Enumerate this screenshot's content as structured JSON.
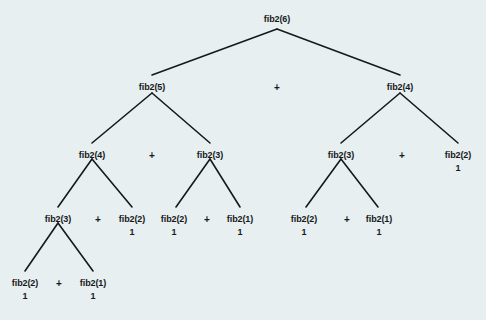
{
  "diagram": {
    "background_color": "#e7eff0",
    "ink_color": "#16191c",
    "levels": 5,
    "nodes": [
      {
        "id": "n0",
        "label": "fib2(6)",
        "value": "",
        "x": 277,
        "y": 14
      },
      {
        "id": "n1",
        "label": "fib2(5)",
        "value": "",
        "x": 152,
        "y": 82
      },
      {
        "id": "n2",
        "label": "fib2(4)",
        "value": "",
        "x": 400,
        "y": 82
      },
      {
        "id": "n3",
        "label": "fib2(4)",
        "value": "",
        "x": 92,
        "y": 150
      },
      {
        "id": "n4",
        "label": "fib2(3)",
        "value": "",
        "x": 210,
        "y": 150
      },
      {
        "id": "n5",
        "label": "fib2(3)",
        "value": "",
        "x": 341,
        "y": 150
      },
      {
        "id": "n6",
        "label": "fib2(2)",
        "value": "1",
        "x": 458,
        "y": 150
      },
      {
        "id": "n7",
        "label": "fib2(3)",
        "value": "",
        "x": 58,
        "y": 214
      },
      {
        "id": "n8",
        "label": "fib2(2)",
        "value": "1",
        "x": 132,
        "y": 214
      },
      {
        "id": "n9",
        "label": "fib2(2)",
        "value": "1",
        "x": 174,
        "y": 214
      },
      {
        "id": "n10",
        "label": "fib2(1)",
        "value": "1",
        "x": 240,
        "y": 214
      },
      {
        "id": "n11",
        "label": "fib2(2)",
        "value": "1",
        "x": 304,
        "y": 214
      },
      {
        "id": "n12",
        "label": "fib2(1)",
        "value": "1",
        "x": 379,
        "y": 214
      },
      {
        "id": "n13",
        "label": "fib2(2)",
        "value": "1",
        "x": 25,
        "y": 278
      },
      {
        "id": "n14",
        "label": "fib2(1)",
        "value": "1",
        "x": 93,
        "y": 278
      }
    ],
    "operators": [
      {
        "id": "p0",
        "symbol": "+",
        "x": 277,
        "y": 82
      },
      {
        "id": "p1",
        "symbol": "+",
        "x": 152,
        "y": 150
      },
      {
        "id": "p2",
        "symbol": "+",
        "x": 402,
        "y": 150
      },
      {
        "id": "p3",
        "symbol": "+",
        "x": 98,
        "y": 214
      },
      {
        "id": "p4",
        "symbol": "+",
        "x": 207,
        "y": 214
      },
      {
        "id": "p5",
        "symbol": "+",
        "x": 347,
        "y": 214
      },
      {
        "id": "p6",
        "symbol": "+",
        "x": 59,
        "y": 278
      }
    ],
    "edges": [
      {
        "from": "n0",
        "to": "n1",
        "x1": 277,
        "y1": 29,
        "x2": 152,
        "y2": 75
      },
      {
        "from": "n0",
        "to": "n2",
        "x1": 277,
        "y1": 29,
        "x2": 400,
        "y2": 75
      },
      {
        "from": "n1",
        "to": "n3",
        "x1": 152,
        "y1": 93,
        "x2": 92,
        "y2": 143
      },
      {
        "from": "n1",
        "to": "n4",
        "x1": 152,
        "y1": 93,
        "x2": 210,
        "y2": 143
      },
      {
        "from": "n2",
        "to": "n5",
        "x1": 400,
        "y1": 93,
        "x2": 341,
        "y2": 143
      },
      {
        "from": "n2",
        "to": "n6",
        "x1": 400,
        "y1": 93,
        "x2": 458,
        "y2": 143
      },
      {
        "from": "n3",
        "to": "n7",
        "x1": 92,
        "y1": 159,
        "x2": 58,
        "y2": 207
      },
      {
        "from": "n3",
        "to": "n8",
        "x1": 92,
        "y1": 159,
        "x2": 132,
        "y2": 207
      },
      {
        "from": "n4",
        "to": "n9",
        "x1": 210,
        "y1": 159,
        "x2": 176,
        "y2": 207
      },
      {
        "from": "n4",
        "to": "n10",
        "x1": 210,
        "y1": 159,
        "x2": 240,
        "y2": 207
      },
      {
        "from": "n5",
        "to": "n11",
        "x1": 341,
        "y1": 159,
        "x2": 306,
        "y2": 207
      },
      {
        "from": "n5",
        "to": "n12",
        "x1": 341,
        "y1": 159,
        "x2": 378,
        "y2": 207
      },
      {
        "from": "n7",
        "to": "n13",
        "x1": 58,
        "y1": 223,
        "x2": 25,
        "y2": 271
      },
      {
        "from": "n7",
        "to": "n14",
        "x1": 58,
        "y1": 223,
        "x2": 93,
        "y2": 271
      }
    ]
  }
}
